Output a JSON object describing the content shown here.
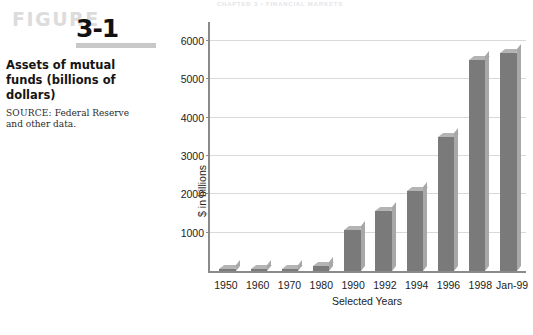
{
  "running_head": "CHAPTER 3  •  FINANCIAL MARKETS",
  "figure": {
    "word": "FIGURE",
    "number": "3-1",
    "caption_title": "Assets of mutual funds (billions of dollars)",
    "source_label": "SOURCE:",
    "source_text": " Federal Reserve and other data."
  },
  "colors": {
    "bar_face": "#7a7a7a",
    "bar_top": "#b4b4b4",
    "bar_side": "#a8a8a8",
    "axis": "#8a8a8a",
    "grid": "#d9d9d9",
    "figure_word": "#dcdcdc",
    "figure_rule": "#c8c8c8"
  },
  "chart_data": {
    "type": "bar",
    "title": "Assets of mutual funds (billions of dollars)",
    "xlabel": "Selected Years",
    "ylabel": "$ in billions",
    "ylim": [
      0,
      6500
    ],
    "yticks": [
      1000,
      2000,
      3000,
      4000,
      5000,
      6000
    ],
    "ytick_labels": [
      "1000",
      "2000",
      "3000",
      "4000",
      "5000",
      "6000"
    ],
    "grid": true,
    "legend": "none",
    "categories": [
      "1950",
      "1960",
      "1970",
      "1980",
      "1990",
      "1992",
      "1994",
      "1996",
      "1998",
      "Jan-99"
    ],
    "values": [
      10,
      20,
      50,
      135,
      1065,
      1570,
      2100,
      3500,
      5500,
      5700
    ],
    "series": [
      {
        "name": "Assets of mutual funds",
        "values": [
          10,
          20,
          50,
          135,
          1065,
          1570,
          2100,
          3500,
          5500,
          5700
        ]
      }
    ]
  }
}
